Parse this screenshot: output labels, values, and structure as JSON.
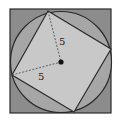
{
  "diagram": {
    "labels": {
      "radius_vertical": "5",
      "radius_horizontal": "5"
    },
    "colors": {
      "outer_square_fill": "#8c8c8c",
      "circle_fill": "#a6a6a6",
      "inner_square_fill": "#c8c8c8",
      "stroke": "#2a2a2a",
      "center_dot": "#111111"
    }
  }
}
